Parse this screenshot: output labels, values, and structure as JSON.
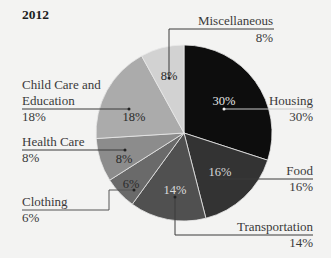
{
  "chart_data": {
    "type": "pie",
    "title": "2012",
    "start_angle_deg": 0,
    "direction": "clockwise",
    "slices": [
      {
        "label": "Housing",
        "value": 30,
        "display": "30%",
        "color": "#0d0d0d",
        "text_color": "#e6e6e6"
      },
      {
        "label": "Food",
        "value": 16,
        "display": "16%",
        "color": "#333333",
        "text_color": "#d8d8d8"
      },
      {
        "label": "Transportation",
        "value": 14,
        "display": "14%",
        "color": "#505050",
        "text_color": "#dcdcdc"
      },
      {
        "label": "Clothing",
        "value": 6,
        "display": "6%",
        "color": "#6a6a6a",
        "text_color": "#2a2a2a"
      },
      {
        "label": "Health Care",
        "value": 8,
        "display": "8%",
        "color": "#8c8c8c",
        "text_color": "#2a2a2a"
      },
      {
        "label": "Child Care and Education",
        "value": 18,
        "display": "18%",
        "color": "#ababab",
        "text_color": "#2a2a2a"
      },
      {
        "label": "Miscellaneous",
        "value": 8,
        "display": "8%",
        "color": "#d2d2d2",
        "text_color": "#2a2a2a"
      }
    ],
    "legend": "callout labels"
  },
  "labels": {
    "title": "2012",
    "housing": {
      "name": "Housing",
      "pct": "30%",
      "inner": "30%"
    },
    "food": {
      "name": "Food",
      "pct": "16%",
      "inner": "16%"
    },
    "transportation": {
      "name": "Transportation",
      "pct": "14%",
      "inner": "14%"
    },
    "clothing": {
      "name": "Clothing",
      "pct": "6%",
      "inner": "6%"
    },
    "health_care": {
      "name": "Health Care",
      "pct": "8%",
      "inner": "8%"
    },
    "child_care": {
      "name_line1": "Child Care and",
      "name_line2": "Education",
      "pct": "18%",
      "inner": "18%"
    },
    "misc": {
      "name": "Miscellaneous",
      "pct": "8%",
      "inner": "8%"
    }
  }
}
